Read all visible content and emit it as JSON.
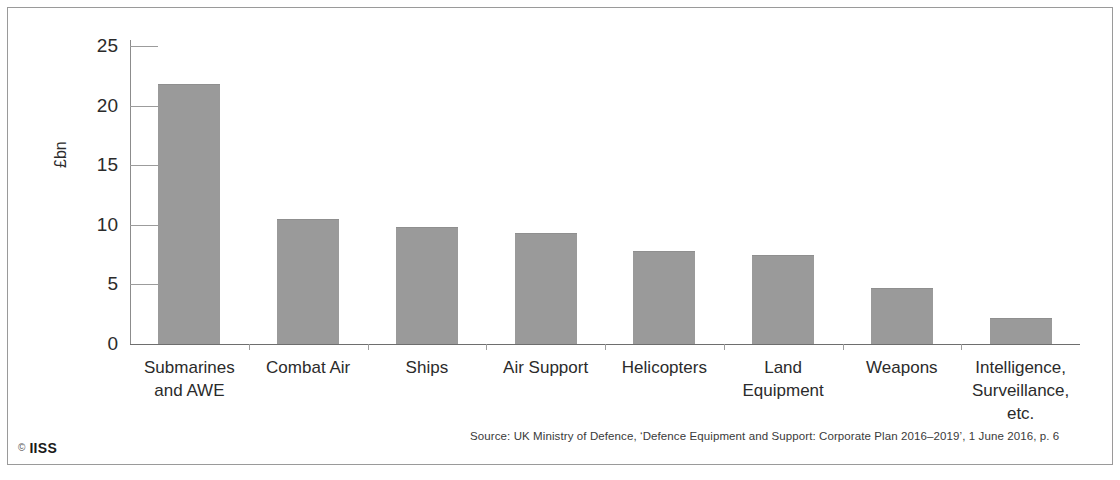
{
  "chart_data": {
    "type": "bar",
    "title": "",
    "xlabel": "",
    "ylabel": "£bn",
    "ylim": [
      0,
      25
    ],
    "yticks": [
      "0",
      "5",
      "10",
      "15",
      "20",
      "25"
    ],
    "ytick_values": [
      0,
      5,
      10,
      15,
      20,
      25
    ],
    "grid": false,
    "legend": "none",
    "bar_color": "#9a9a9a",
    "categories": [
      "Submarines and AWE",
      "Combat Air",
      "Ships",
      "Air Support",
      "Helicopters",
      "Land Equipment",
      "Weapons",
      "Intelligence, Surveillance, etc."
    ],
    "category_lines": [
      [
        "Submarines",
        "and AWE"
      ],
      [
        "Combat Air"
      ],
      [
        "Ships"
      ],
      [
        "Air Support"
      ],
      [
        "Helicopters"
      ],
      [
        "Land",
        "Equipment"
      ],
      [
        "Weapons"
      ],
      [
        "Intelligence,",
        "Surveillance, etc."
      ]
    ],
    "values": [
      21.8,
      10.5,
      9.8,
      9.3,
      7.8,
      7.5,
      4.7,
      2.2
    ]
  },
  "footer": {
    "source": "Source: UK Ministry of Defence, ‘Defence Equipment and Support: Corporate Plan 2016–2019’, 1 June 2016, p. 6",
    "logo_mark": "©",
    "logo_text": "IISS"
  }
}
